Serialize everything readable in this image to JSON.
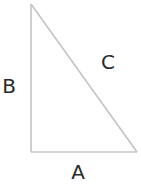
{
  "diagram": {
    "type": "right-triangle",
    "stroke_color": "#c4c4c4",
    "label_color": "#2a2a2a",
    "vertices": {
      "top": [
        31,
        4
      ],
      "bottom_left": [
        31,
        152
      ],
      "bottom_right": [
        137,
        152
      ]
    },
    "sides": {
      "A": {
        "label": "A",
        "description": "horizontal leg (bottom)"
      },
      "B": {
        "label": "B",
        "description": "vertical leg (left)"
      },
      "C": {
        "label": "C",
        "description": "hypotenuse"
      }
    }
  }
}
